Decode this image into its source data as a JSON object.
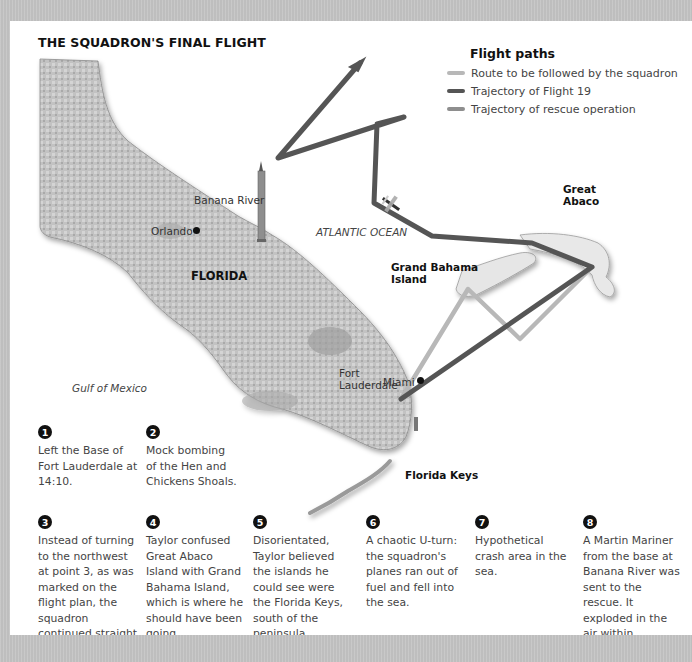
{
  "title": "THE SQUADRON'S FINAL FLIGHT",
  "legend": {
    "title": "Flight paths",
    "items": [
      {
        "label": "Route to be followed by the squadron",
        "color": "#b8b8b8"
      },
      {
        "label": "Trajectory of Flight 19",
        "color": "#555555"
      },
      {
        "label": "Trajectory of rescue operation",
        "color": "#8e8e8e"
      }
    ]
  },
  "map_labels": {
    "banana_river": "Banana River",
    "orlando": "Orlando",
    "florida": "FLORIDA",
    "gulf_of_mexico": "Gulf of Mexico",
    "atlantic_ocean": "ATLANTIC OCEAN",
    "grand_bahama": "Grand Bahama\nIsland",
    "grand_bahama_line1": "Grand Bahama",
    "grand_bahama_line2": "Island",
    "great_abaco_line1": "Great",
    "great_abaco_line2": "Abaco",
    "fort_lauderdale_line1": "Fort",
    "fort_lauderdale_line2": "Lauderdale",
    "miami": "Miami",
    "florida_keys": "Florida Keys"
  },
  "notes": [
    {
      "num": "1",
      "text": "Left the Base of Fort Lauderdale at 14:10."
    },
    {
      "num": "2",
      "text": "Mock bombing of the Hen and Chickens Shoals."
    },
    {
      "num": "3",
      "text": "Instead of turning to the northwest at point 3, as was marked on the flight plan, the squadron continued straight ahead."
    },
    {
      "num": "4",
      "text": "Taylor confused Great Abaco Island with Grand Bahama Island, which is where he should have been going."
    },
    {
      "num": "5",
      "text": "Disorientated, Taylor believed the islands he could see were the Florida Keys, south of the peninsula."
    },
    {
      "num": "6",
      "text": "A chaotic U-turn: the squadron's planes ran out of fuel and fell into the sea."
    },
    {
      "num": "7",
      "text": "Hypothetical crash area in the sea."
    },
    {
      "num": "8",
      "text": "A Martin Mariner from the base at Banana River was sent to the rescue. It exploded in the air within minutes."
    }
  ],
  "colors": {
    "frame": "#c4c4c4",
    "land": "#bdbdbd",
    "planned_route": "#b8b8b8",
    "flight19": "#555555",
    "rescue": "#8e8e8e"
  }
}
